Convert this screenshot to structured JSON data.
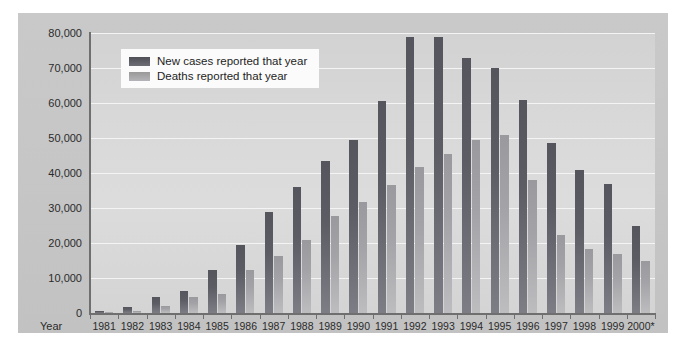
{
  "chart_data": {
    "type": "bar",
    "title": "",
    "xlabel": "Year",
    "ylabel": "",
    "ylim": [
      0,
      80000
    ],
    "ytick_values": [
      0,
      10000,
      20000,
      30000,
      40000,
      50000,
      60000,
      70000,
      80000
    ],
    "ytick_labels": [
      "0",
      "10,000",
      "20,000",
      "30,000",
      "40,000",
      "50,000",
      "60,000",
      "70,000",
      "80,000"
    ],
    "grid": true,
    "legend_position": "upper-left-inside",
    "categories": [
      "1981",
      "1982",
      "1983",
      "1984",
      "1985",
      "1986",
      "1987",
      "1988",
      "1989",
      "1990",
      "1991",
      "1992",
      "1993",
      "1994",
      "1995",
      "1996",
      "1997",
      "1998",
      "1999",
      "2000*"
    ],
    "series": [
      {
        "name": "New cases reported that year",
        "color": "#57575f",
        "values": [
          600,
          1600,
          4500,
          6200,
          12200,
          19300,
          29000,
          36000,
          43500,
          49400,
          60600,
          78800,
          79000,
          73000,
          69900,
          60800,
          48500,
          41000,
          37000,
          24800
        ]
      },
      {
        "name": "Deaths reported that year",
        "color": "#a0a0a4",
        "values": [
          200,
          700,
          2100,
          4500,
          5500,
          12200,
          16200,
          21000,
          27800,
          31700,
          36700,
          41700,
          45300,
          49500,
          51000,
          38000,
          22300,
          18200,
          16800,
          15000
        ]
      }
    ]
  },
  "legend": {
    "items": [
      {
        "label": "New cases reported that year",
        "swatch": "cases"
      },
      {
        "label": "Deaths reported that year",
        "swatch": "deaths"
      }
    ]
  },
  "axis": {
    "x_caption": "Year"
  }
}
